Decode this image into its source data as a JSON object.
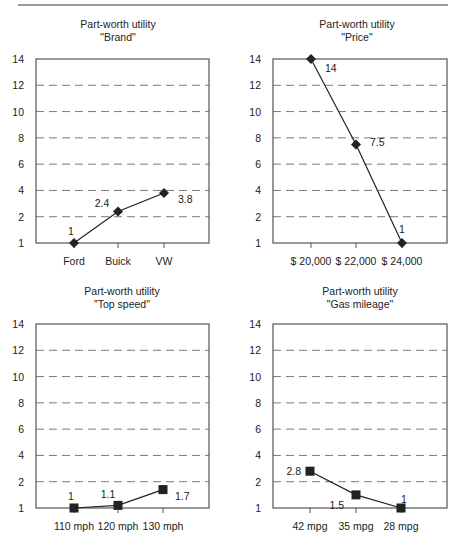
{
  "chart_data": [
    {
      "type": "line",
      "title": "Part-worth utility",
      "subtitle": "\"Brand\"",
      "categories": [
        "Ford",
        "Buick",
        "VW"
      ],
      "values": [
        1,
        2.4,
        3.8
      ],
      "value_labels": [
        "1",
        "2.4",
        "3.8"
      ],
      "xlabel": "",
      "ylabel": "",
      "yticks": [
        1,
        2,
        4,
        6,
        8,
        10,
        12,
        14
      ],
      "ylim": [
        1,
        14
      ],
      "grid": "horizontal dashed",
      "marker": "diamond"
    },
    {
      "type": "line",
      "title": "Part-worth utility",
      "subtitle": "\"Price\"",
      "categories": [
        "$ 20,000",
        "$ 22,000",
        "$ 24,000"
      ],
      "values": [
        14,
        7.5,
        1
      ],
      "value_labels": [
        "14",
        "7.5",
        "1"
      ],
      "xlabel": "",
      "ylabel": "",
      "yticks": [
        1,
        2,
        4,
        6,
        8,
        10,
        12,
        14
      ],
      "ylim": [
        1,
        14
      ],
      "grid": "horizontal dashed",
      "marker": "diamond"
    },
    {
      "type": "line",
      "title": "Part-worth utility",
      "subtitle": "\"Top speed\"",
      "categories": [
        "110 mph",
        "120 mph",
        "130 mph"
      ],
      "values": [
        1,
        1.1,
        1.7
      ],
      "value_labels": [
        "1",
        "1.1",
        "1.7"
      ],
      "xlabel": "",
      "ylabel": "",
      "yticks": [
        1,
        2,
        4,
        6,
        8,
        10,
        12,
        14
      ],
      "ylim": [
        1,
        14
      ],
      "grid": "horizontal dashed",
      "marker": "square"
    },
    {
      "type": "line",
      "title": "Part-worth utility",
      "subtitle": "\"Gas mileage\"",
      "categories": [
        "42 mpg",
        "35 mpg",
        "28 mpg"
      ],
      "values": [
        2.8,
        1.5,
        1
      ],
      "value_labels": [
        "2.8",
        "1.5",
        "1"
      ],
      "xlabel": "",
      "ylabel": "",
      "yticks": [
        1,
        2,
        4,
        6,
        8,
        10,
        12,
        14
      ],
      "ylim": [
        1,
        14
      ],
      "grid": "horizontal dashed",
      "marker": "square"
    }
  ],
  "colors": {
    "line": "#222222",
    "grid": "#7a7a7a",
    "axis": "#555555",
    "rule": "#9a9a9a"
  }
}
